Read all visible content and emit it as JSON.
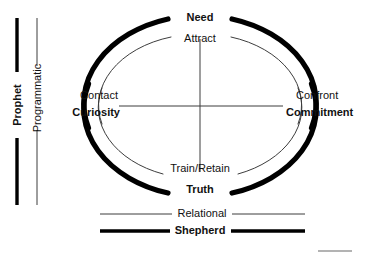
{
  "diagram": {
    "colors": {
      "ink": "#111111",
      "thin_line": "#4a4a4a",
      "thick_line": "#000000",
      "background": "#ffffff",
      "artifact_gray": "#9a9a9a"
    },
    "axis_left": {
      "outer_label": "Prophet",
      "inner_label": "Programmatic"
    },
    "legend_bottom": {
      "thin_label": "Relational",
      "thick_label": "Shepherd"
    },
    "nodes": {
      "top": {
        "outer": "Need",
        "inner": "Attract"
      },
      "right": {
        "outer": "Commitment",
        "inner": "Confront"
      },
      "bottom": {
        "outer": "Truth",
        "inner": "Train/Retain"
      },
      "left": {
        "outer": "Curiosity",
        "inner": "Contact"
      }
    },
    "rings": [
      {
        "name": "outer-ring",
        "style": "thick",
        "semantic": "Prophet / Shepherd"
      },
      {
        "name": "inner-ring",
        "style": "thin",
        "semantic": "Programmatic / Relational"
      }
    ],
    "center_cross": {
      "present": true,
      "semantic": "quadrant-axes"
    }
  }
}
